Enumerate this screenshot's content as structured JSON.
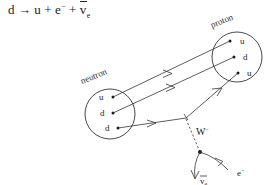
{
  "equation": {
    "full_text": "d → u + e⁻ + ν̄e",
    "lhs": "d",
    "arrow": "→",
    "product_quark": "u",
    "plus_1": "+",
    "product_electron": "e",
    "electron_charge": "−",
    "plus_2": "+",
    "product_antineutrino": "v",
    "antineutrino_subscript": "e"
  },
  "neutron": {
    "label": "neutron",
    "quarks": [
      "u",
      "d",
      "d"
    ]
  },
  "proton": {
    "label": "proton",
    "quarks": [
      "u",
      "d",
      "u"
    ]
  },
  "boson": {
    "label": "W",
    "charge": "−"
  },
  "leptons": {
    "electron_label": "e",
    "electron_charge": "−",
    "antineutrino_label": "v",
    "antineutrino_subscript": "e"
  },
  "colors": {
    "ink": "#333333",
    "text": "#222222",
    "background": "#ffffff"
  }
}
